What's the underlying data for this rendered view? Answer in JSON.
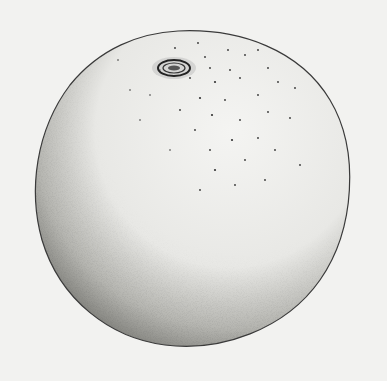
{
  "figure": {
    "colors": {
      "paper": "#f2f2f0",
      "ink": "#2a2a2a",
      "bleed_through": "#d9d9d6"
    }
  }
}
